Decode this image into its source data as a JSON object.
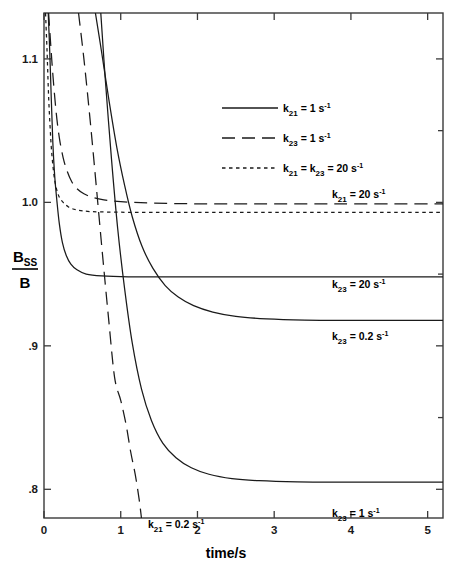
{
  "chart_data": {
    "type": "line",
    "title": "",
    "xlabel": "time/s",
    "ylabel": "B_SS/B",
    "xlim": [
      0,
      5.2
    ],
    "ylim": [
      0.78,
      1.132
    ],
    "grid": false,
    "legend_position": "upper-center",
    "x_ticks": [
      "0",
      "1",
      "2",
      "3",
      "4",
      "5"
    ],
    "x_tick_values": [
      0,
      1,
      2,
      3,
      4,
      5
    ],
    "y_ticks": [
      "1.1",
      "1.0",
      ".9",
      ".8"
    ],
    "y_tick_values": [
      1.1,
      1.0,
      0.9,
      0.8
    ],
    "series": [
      {
        "name": "k21 = 20 s-1",
        "style": "dotted",
        "asymptote": 0.993,
        "rate": 20,
        "label": "k_21 = 20 s^-1",
        "points_x": [
          0.02,
          0.04,
          0.06,
          0.08,
          0.1,
          0.13,
          0.16,
          0.2,
          0.25,
          0.32,
          0.42,
          0.6,
          0.9,
          1.4,
          2.2,
          3.2,
          4.2,
          5.2
        ],
        "points_y": [
          1.132,
          1.105,
          1.074,
          1.052,
          1.035,
          1.019,
          1.01,
          1.0035,
          1.0,
          0.9968,
          0.9948,
          0.9936,
          0.9932,
          0.993,
          0.993,
          0.993,
          0.993,
          0.993
        ]
      },
      {
        "name": "k23 = 20 s-1",
        "style": "solid",
        "asymptote": 0.948,
        "rate": 20,
        "label": "k_23 = 20 s^-1",
        "points_x": [
          0.055,
          0.075,
          0.095,
          0.115,
          0.14,
          0.17,
          0.2,
          0.24,
          0.29,
          0.35,
          0.43,
          0.55,
          0.75,
          1.1,
          1.8,
          2.6,
          3.6,
          4.6,
          5.2
        ],
        "points_y": [
          1.132,
          1.105,
          1.072,
          1.042,
          1.018,
          1.0,
          0.985,
          0.972,
          0.963,
          0.957,
          0.953,
          0.95,
          0.9487,
          0.9481,
          0.948,
          0.948,
          0.948,
          0.948,
          0.948
        ]
      },
      {
        "name": "k21 = 1 s-1",
        "style": "longdash",
        "asymptote": 1.0,
        "rate": 1,
        "label": "k_21 = 1 s^-1",
        "points_x": [
          0.06,
          0.09,
          0.12,
          0.16,
          0.2,
          0.25,
          0.3,
          0.36,
          0.43,
          0.52,
          0.63,
          0.78,
          1.0,
          1.4,
          2.0,
          2.8,
          3.8,
          4.8,
          5.2
        ],
        "points_y": [
          1.132,
          1.108,
          1.086,
          1.062,
          1.045,
          1.031,
          1.022,
          1.0145,
          1.0095,
          1.006,
          1.0035,
          1.0018,
          1.0005,
          0.9995,
          0.999,
          0.999,
          0.999,
          0.999,
          0.999
        ]
      },
      {
        "name": "k23 = 0.2 s-1",
        "style": "solid",
        "asymptote": 0.918,
        "rate": 0.2,
        "label": "k_23 = 0.2 s^-1",
        "points_x": [
          0.67,
          0.75,
          0.85,
          0.95,
          1.05,
          1.15,
          1.28,
          1.42,
          1.58,
          1.75,
          1.95,
          2.2,
          2.5,
          2.9,
          3.4,
          4.0,
          4.6,
          5.2
        ],
        "points_y": [
          1.132,
          1.105,
          1.07,
          1.038,
          1.012,
          0.99,
          0.969,
          0.954,
          0.942,
          0.934,
          0.928,
          0.9235,
          0.9205,
          0.9188,
          0.918,
          0.9178,
          0.9178,
          0.9178
        ]
      },
      {
        "name": "k23 = 1 s-1",
        "style": "solid",
        "asymptote": 0.805,
        "rate": 1,
        "label": "k_23 = 1 s^-1",
        "points_x": [
          0.74,
          0.8,
          0.88,
          0.96,
          1.05,
          1.15,
          1.27,
          1.4,
          1.55,
          1.72,
          1.92,
          2.15,
          2.45,
          2.8,
          3.3,
          3.9,
          4.5,
          5.2
        ],
        "points_y": [
          1.132,
          1.085,
          1.03,
          0.982,
          0.94,
          0.902,
          0.87,
          0.848,
          0.832,
          0.822,
          0.815,
          0.8105,
          0.8075,
          0.806,
          0.8052,
          0.805,
          0.805,
          0.805
        ]
      },
      {
        "name": "k21 = 0.2 s-1",
        "style": "longdash",
        "asymptote": null,
        "rate": 0.2,
        "label": "k_21 = 0.2 s^-1",
        "points_x": [
          0.45,
          0.52,
          0.6,
          0.68,
          0.76,
          0.84,
          0.92,
          1.0,
          1.07,
          1.13,
          1.19,
          1.24,
          1.27
        ],
        "points_y": [
          1.132,
          1.1,
          1.058,
          1.012,
          0.965,
          0.92,
          0.878,
          0.862,
          0.845,
          0.826,
          0.81,
          0.793,
          0.78
        ]
      }
    ],
    "annotations": [
      {
        "name": "k21-20-label",
        "base": "k",
        "sub": "21",
        "eq": "= 20 s",
        "sup": "-1",
        "x": 332,
        "y": 198
      },
      {
        "name": "k23-20-label",
        "base": "k",
        "sub": "23",
        "eq": "= 20 s",
        "sup": "-1",
        "x": 332,
        "y": 288
      },
      {
        "name": "k23-02-label",
        "base": "k",
        "sub": "23",
        "eq": "= 0.2 s",
        "sup": "-1",
        "x": 332,
        "y": 340
      },
      {
        "name": "k23-1-label",
        "base": "k",
        "sub": "23",
        "eq": "= 1 s",
        "sup": "-1",
        "x": 332,
        "y": 517
      },
      {
        "name": "k21-02-label",
        "base": "k",
        "sub": "21",
        "eq": "= 0.2 s",
        "sup": "-1",
        "x": 148,
        "y": 528
      }
    ],
    "legend_entries": [
      {
        "name": "legend-k21-1",
        "style": "solid",
        "base": "k",
        "sub": "21",
        "eq": "= 1 s",
        "sup": "-1"
      },
      {
        "name": "legend-k23-1",
        "style": "longdash",
        "base": "k",
        "sub": "23",
        "eq": "= 1 s",
        "sup": "-1"
      },
      {
        "name": "legend-k21-k23-20",
        "style": "dotted",
        "base": "k",
        "sub": "21",
        "eq": "=",
        "base2": "k",
        "sub2": "23",
        "eq2": "= 20 s",
        "sup": "-1"
      }
    ]
  },
  "axis": {
    "x_title": "time/s",
    "y_numerator": "B",
    "y_numerator_sub": "SS",
    "y_denominator": "B"
  },
  "colors": {
    "line": "#1a1a1a",
    "axis": "#3a3a3a",
    "background": "#ffffff"
  }
}
